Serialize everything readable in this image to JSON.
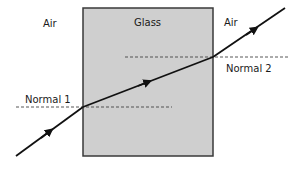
{
  "diagram": {
    "labels": {
      "air_left": "Air",
      "glass": "Glass",
      "air_right": "Air",
      "normal_1": "Normal 1",
      "normal_2": "Normal 2"
    },
    "colors": {
      "glass_fill": "#cfcfcf",
      "glass_border": "#3a3a3a",
      "ray": "#111111",
      "normal": "#444444"
    }
  }
}
